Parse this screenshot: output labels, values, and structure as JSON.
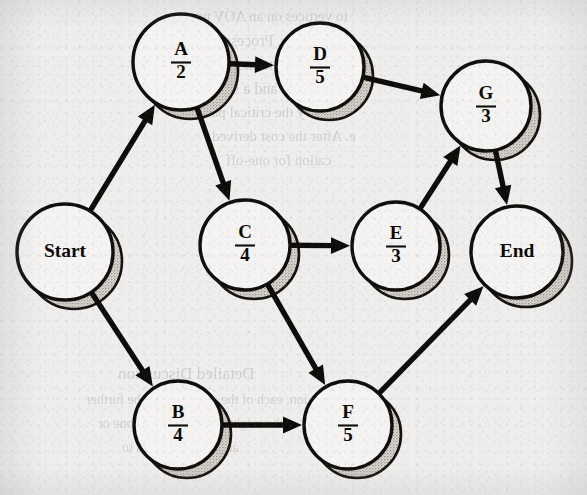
{
  "document": {
    "kind": "scanned-book-figure",
    "figure_type": "AOV activity network diagram",
    "background_color": "#efeeec",
    "ink_color": "#0e0c09",
    "node_fill_color": "#f4f3f1",
    "shadow_color": "#b9b6ae"
  },
  "graph": {
    "layout": "left-to-right directed acyclic graph",
    "node_radius": 46,
    "shadow_offset": {
      "x": 9,
      "y": 9
    },
    "nodes": [
      {
        "id": "start",
        "name": "start-node",
        "label": "Start",
        "letter": "Start",
        "duration": "",
        "kind": "terminal",
        "cx": 65,
        "cy": 252,
        "r": 48
      },
      {
        "id": "A",
        "name": "node-a",
        "label": "A/2",
        "letter": "A",
        "duration": "2",
        "kind": "activity",
        "cx": 181,
        "cy": 62,
        "r": 48
      },
      {
        "id": "D",
        "name": "node-d",
        "label": "D/5",
        "letter": "D",
        "duration": "5",
        "kind": "activity",
        "cx": 320,
        "cy": 67,
        "r": 44
      },
      {
        "id": "G",
        "name": "node-g",
        "label": "G/3",
        "letter": "G",
        "duration": "3",
        "kind": "activity",
        "cx": 486,
        "cy": 106,
        "r": 45
      },
      {
        "id": "C",
        "name": "node-c",
        "label": "C/4",
        "letter": "C",
        "duration": "4",
        "kind": "activity",
        "cx": 245,
        "cy": 245,
        "r": 45
      },
      {
        "id": "E",
        "name": "node-e",
        "label": "E/3",
        "letter": "E",
        "duration": "3",
        "kind": "activity",
        "cx": 396,
        "cy": 246,
        "r": 44
      },
      {
        "id": "end",
        "name": "end-node",
        "label": "End",
        "letter": "End",
        "duration": "",
        "kind": "terminal",
        "cx": 517,
        "cy": 252,
        "r": 46
      },
      {
        "id": "B",
        "name": "node-b",
        "label": "B/4",
        "letter": "B",
        "duration": "4",
        "kind": "activity",
        "cx": 178,
        "cy": 425,
        "r": 44
      },
      {
        "id": "F",
        "name": "node-f",
        "label": "F/5",
        "letter": "F",
        "duration": "5",
        "kind": "activity",
        "cx": 348,
        "cy": 425,
        "r": 44
      }
    ],
    "edges": [
      {
        "name": "edge-start-a",
        "from": "start",
        "to": "A"
      },
      {
        "name": "edge-start-b",
        "from": "start",
        "to": "B"
      },
      {
        "name": "edge-a-d",
        "from": "A",
        "to": "D"
      },
      {
        "name": "edge-a-c",
        "from": "A",
        "to": "C"
      },
      {
        "name": "edge-d-g",
        "from": "D",
        "to": "G"
      },
      {
        "name": "edge-c-e",
        "from": "C",
        "to": "E"
      },
      {
        "name": "edge-c-f",
        "from": "C",
        "to": "F"
      },
      {
        "name": "edge-b-f",
        "from": "B",
        "to": "F"
      },
      {
        "name": "edge-e-g",
        "from": "E",
        "to": "G"
      },
      {
        "name": "edge-g-end",
        "from": "G",
        "to": "end"
      },
      {
        "name": "edge-f-end",
        "from": "F",
        "to": "end"
      }
    ]
  },
  "bleed_through_text": [
    {
      "text": "to vertices on an AOV ne",
      "x": 196,
      "y": 8,
      "size": 15
    },
    {
      "text": "an activity. Process is",
      "x": 210,
      "y": 32,
      "size": 16
    },
    {
      "text": "ost of the attainable",
      "x": 218,
      "y": 56,
      "size": 16
    },
    {
      "text": "cost of this and a sc",
      "x": 226,
      "y": 80,
      "size": 16
    },
    {
      "text": "ecessary the critical path",
      "x": 200,
      "y": 104,
      "size": 15
    },
    {
      "text": "e. After the cost derived",
      "x": 212,
      "y": 128,
      "size": 15
    },
    {
      "text": "cation for one-off",
      "x": 226,
      "y": 152,
      "size": 15
    },
    {
      "text": "Detailed Discussion",
      "x": 118,
      "y": 364,
      "size": 17
    },
    {
      "text": "ion, each of the activities can be further",
      "x": 86,
      "y": 392,
      "size": 14
    },
    {
      "text": "who might directly execute one or",
      "x": 98,
      "y": 416,
      "size": 14
    },
    {
      "text": "and then the items to",
      "x": 122,
      "y": 440,
      "size": 14
    },
    {
      "text": "of the",
      "x": 170,
      "y": 466,
      "size": 14
    }
  ]
}
